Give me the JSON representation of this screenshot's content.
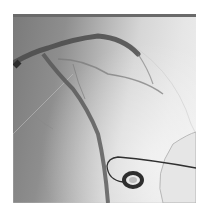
{
  "image": {
    "description": "Coronary angiogram grayscale X-ray showing contrast-filled coronary arteries with a guidewire loop and circular device",
    "colors": {
      "background": "#ffffff",
      "vessel": "#4a4a4a",
      "wire": "#303030"
    }
  }
}
